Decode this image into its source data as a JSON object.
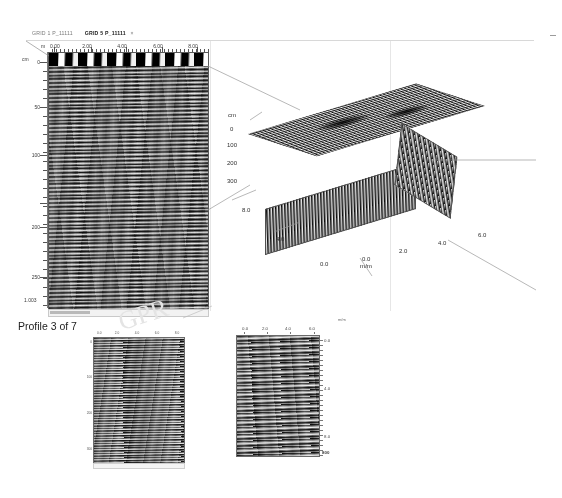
{
  "window": {
    "minimize_glyph": "—"
  },
  "tabs": [
    {
      "label": "GRID 1 P_11111",
      "active": false
    },
    {
      "label": "GRID 5 P_11111",
      "active": true,
      "close_glyph": "×"
    }
  ],
  "main_profile": {
    "name": "main-radargram",
    "horizontal_unit": "m",
    "vertical_unit": "cm",
    "x_ticks": [
      "0.00",
      "2.00",
      "4.00",
      "6.00",
      "8.00"
    ],
    "y_ticks": [
      "0",
      "50",
      "100",
      "150",
      "200",
      "250"
    ],
    "trace_label": "1.003"
  },
  "block3d": {
    "name": "3d-block-diagram",
    "depth_unit": "cm",
    "depth_ticks": [
      "0",
      "100",
      "200",
      "300"
    ],
    "axis_label": "m/m",
    "left_axis_ticks": [
      "8.0",
      "4.0",
      "0.0"
    ],
    "bottom_axis_ticks": [
      "0.0",
      "2.0",
      "4.0",
      "6.0"
    ]
  },
  "caption": {
    "profile_text": "Profile 3 of 7"
  },
  "watermark": {
    "text": "GPR"
  },
  "profile_b": {
    "name": "bottom-middle-radargram",
    "x_ticks": [
      "0.0",
      "2.0",
      "4.0",
      "6.0",
      "8.0"
    ],
    "y_ticks": [
      "0",
      "100",
      "200",
      "300"
    ]
  },
  "profile_c": {
    "name": "bottom-right-radargram",
    "unit": "m/m",
    "x_ticks": [
      "0.0",
      "2.0",
      "4.0",
      "6.0"
    ],
    "y_ticks": [
      "0.0",
      "4.0",
      "8.0"
    ],
    "bottom_value": "800"
  },
  "chart_data": {
    "type": "heatmap",
    "panels": [
      {
        "id": "main-radargram",
        "xlabel": "m",
        "ylabel": "cm",
        "xlim": [
          0.0,
          8.8
        ],
        "ylim": [
          0,
          280
        ],
        "xticks": [
          0.0,
          2.0,
          4.0,
          6.0,
          8.0
        ],
        "yticks": [
          0,
          50,
          100,
          150,
          200,
          250
        ],
        "grid": false,
        "colormap": "grayscale",
        "annotation": "1.003"
      },
      {
        "id": "3d-block",
        "xlabel": "m/m",
        "zlabel": "cm",
        "xticks": [
          0.0,
          2.0,
          4.0,
          6.0
        ],
        "yticks": [
          0.0,
          4.0,
          8.0
        ],
        "zticks": [
          0,
          100,
          200,
          300
        ],
        "grid": false,
        "colormap": "grayscale"
      },
      {
        "id": "bottom-middle-radargram",
        "xticks": [
          0.0,
          2.0,
          4.0,
          6.0,
          8.0
        ],
        "yticks": [
          0,
          100,
          200,
          300
        ],
        "grid": false,
        "colormap": "grayscale"
      },
      {
        "id": "bottom-right-radargram",
        "xlabel": "m/m",
        "xticks": [
          0.0,
          2.0,
          4.0,
          6.0
        ],
        "yticks": [
          0.0,
          4.0,
          8.0
        ],
        "grid": false,
        "colormap": "grayscale",
        "annotation": "800"
      }
    ]
  }
}
